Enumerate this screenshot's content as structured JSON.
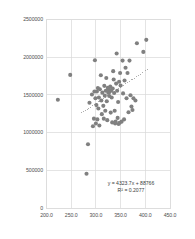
{
  "chart_data": {
    "type": "scatter",
    "title": "",
    "xlabel": "",
    "ylabel": "",
    "xlim": [
      200.0,
      450.0
    ],
    "ylim": [
      0,
      2500000
    ],
    "grid": true,
    "legend": false,
    "marker_color": "#808080",
    "trendline_color": "#999999",
    "frame_color": "#d9d9d9",
    "grid_color": "#d9d9d9",
    "xticks": [
      "200.0",
      "250.0",
      "300.0",
      "350.0",
      "400.0",
      "450.0"
    ],
    "xtick_values": [
      200,
      250,
      300,
      350,
      400,
      450
    ],
    "yticks": [
      "0",
      "500000",
      "1000000",
      "1500000",
      "2000000",
      "2500000"
    ],
    "ytick_values": [
      0,
      500000,
      1000000,
      1500000,
      2000000,
      2500000
    ],
    "annotations": [
      "y = 4323.7x + 88766",
      "R² = 0.2077"
    ],
    "equation_slope": 4323.7,
    "equation_intercept": 88766,
    "r_squared": 0.2077,
    "trendline_x": [
      270,
      405
    ],
    "points": [
      [
        223,
        1435000
      ],
      [
        248,
        1765000
      ],
      [
        281,
        455000
      ],
      [
        284,
        845000
      ],
      [
        287,
        1395000
      ],
      [
        292,
        1505000
      ],
      [
        294,
        1085000
      ],
      [
        296,
        1185000
      ],
      [
        297,
        1545000
      ],
      [
        298,
        1960000
      ],
      [
        299,
        1455000
      ],
      [
        300,
        1120000
      ],
      [
        301,
        1365000
      ],
      [
        302,
        1545000
      ],
      [
        303,
        1175000
      ],
      [
        304,
        1590000
      ],
      [
        305,
        1320000
      ],
      [
        306,
        1465000
      ],
      [
        307,
        1095000
      ],
      [
        308,
        1575000
      ],
      [
        310,
        1760000
      ],
      [
        311,
        1425000
      ],
      [
        312,
        1245000
      ],
      [
        313,
        1530000
      ],
      [
        315,
        1355000
      ],
      [
        316,
        1185000
      ],
      [
        317,
        1620000
      ],
      [
        318,
        1490000
      ],
      [
        319,
        1290000
      ],
      [
        320,
        1555000
      ],
      [
        321,
        1725000
      ],
      [
        322,
        1415000
      ],
      [
        323,
        1165000
      ],
      [
        324,
        1595000
      ],
      [
        325,
        1530000
      ],
      [
        326,
        1570000
      ],
      [
        327,
        1485000
      ],
      [
        328,
        1545000
      ],
      [
        329,
        1610000
      ],
      [
        330,
        1265000
      ],
      [
        331,
        1560000
      ],
      [
        332,
        1465000
      ],
      [
        333,
        1135000
      ],
      [
        334,
        1585000
      ],
      [
        335,
        1815000
      ],
      [
        336,
        1705000
      ],
      [
        337,
        1525000
      ],
      [
        338,
        1290000
      ],
      [
        339,
        1120000
      ],
      [
        340,
        1145000
      ],
      [
        341,
        1650000
      ],
      [
        342,
        2050000
      ],
      [
        343,
        1555000
      ],
      [
        344,
        1195000
      ],
      [
        345,
        1405000
      ],
      [
        346,
        1115000
      ],
      [
        347,
        1675000
      ],
      [
        348,
        1130000
      ],
      [
        349,
        1790000
      ],
      [
        350,
        1625000
      ],
      [
        352,
        1145000
      ],
      [
        354,
        1955000
      ],
      [
        355,
        1520000
      ],
      [
        357,
        1175000
      ],
      [
        358,
        1690000
      ],
      [
        360,
        1860000
      ],
      [
        362,
        1455000
      ],
      [
        364,
        1790000
      ],
      [
        366,
        1270000
      ],
      [
        368,
        1955000
      ],
      [
        370,
        1495000
      ],
      [
        372,
        1345000
      ],
      [
        374,
        1300000
      ],
      [
        376,
        1455000
      ],
      [
        380,
        1425000
      ],
      [
        383,
        2185000
      ],
      [
        396,
        2070000
      ],
      [
        402,
        2230000
      ]
    ]
  }
}
